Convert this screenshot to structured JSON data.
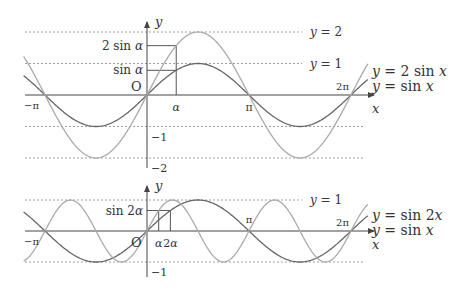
{
  "colors": {
    "background": "#ffffff",
    "axis": "#444444",
    "text": "#333333",
    "dotted": "#888888",
    "curve_dark": "#666666",
    "curve_light": "#aaaaaa"
  },
  "chart_data": [
    {
      "type": "line",
      "name": "top-graph",
      "xlabel": "x",
      "ylabel": "y",
      "origin_label": "O",
      "x_range": [
        -3.8,
        6.8
      ],
      "y_range": [
        -2.3,
        2.4
      ],
      "alpha": 0.9,
      "series": [
        {
          "name": "y = sin x",
          "function": "sin(x)",
          "amplitude": 1,
          "frequency": 1,
          "color": "#666666",
          "domain": [
            -3.8,
            6.8
          ]
        },
        {
          "name": "y = 2 sin x",
          "function": "2 sin(x)",
          "amplitude": 2,
          "frequency": 1,
          "color": "#aaaaaa",
          "domain": [
            -3.8,
            6.8
          ]
        }
      ],
      "x_ticks": [
        {
          "value": -3.14159,
          "label": "−π"
        },
        {
          "value": 0.9,
          "label": "α"
        },
        {
          "value": 3.14159,
          "label": "π"
        },
        {
          "value": 6.28318,
          "label": "2π"
        }
      ],
      "y_ticks": [
        {
          "value": -1,
          "label": "−1"
        },
        {
          "value": -2,
          "label": "−2"
        }
      ],
      "reference_lines": [
        {
          "y": 2,
          "label": "y = 2"
        },
        {
          "y": 1,
          "label": "y = 1"
        },
        {
          "y": -1,
          "label": ""
        },
        {
          "y": -2,
          "label": ""
        }
      ],
      "annotations": [
        {
          "label": "2 sin α",
          "value_expr": "2 sin(α)"
        },
        {
          "label": "sin α",
          "value_expr": "sin(α)"
        }
      ],
      "legend": [
        "y = 2 sin x",
        "y = sin x"
      ],
      "legend_position": "right"
    },
    {
      "type": "line",
      "name": "bottom-graph",
      "xlabel": "x",
      "ylabel": "y",
      "origin_label": "O",
      "x_range": [
        -3.8,
        6.8
      ],
      "y_range": [
        -1.1,
        1.2
      ],
      "alpha": 0.36,
      "series": [
        {
          "name": "y = sin x",
          "function": "sin(x)",
          "amplitude": 1,
          "frequency": 1,
          "color": "#666666",
          "domain": [
            -3.8,
            6.8
          ]
        },
        {
          "name": "y = sin 2x",
          "function": "sin(2x)",
          "amplitude": 1,
          "frequency": 2,
          "color": "#aaaaaa",
          "domain": [
            -3.8,
            6.8
          ]
        }
      ],
      "x_ticks": [
        {
          "value": -3.14159,
          "label": "−π"
        },
        {
          "value": 0.36,
          "label": "α"
        },
        {
          "value": 0.72,
          "label": "2α"
        },
        {
          "value": 3.14159,
          "label": "π"
        },
        {
          "value": 6.28318,
          "label": "2π"
        }
      ],
      "y_ticks": [
        {
          "value": -1,
          "label": "−1"
        }
      ],
      "reference_lines": [
        {
          "y": 1,
          "label": "y = 1"
        },
        {
          "y": -1,
          "label": ""
        }
      ],
      "annotations": [
        {
          "label": "sin 2α",
          "value_expr": "sin(2α)"
        }
      ],
      "legend": [
        "y = sin 2x",
        "y = sin x"
      ],
      "legend_position": "right"
    }
  ]
}
